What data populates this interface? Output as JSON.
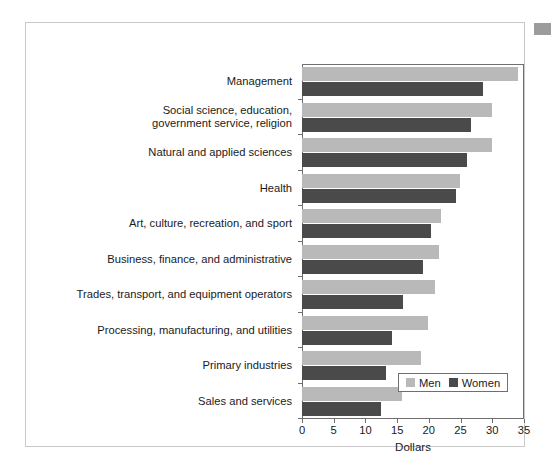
{
  "figure": {
    "axis_title": "Dollars",
    "colors": {
      "men": "#b9b9b9",
      "women": "#4a4a4a",
      "axis": "#6f6f6f",
      "frame": "#c9c9c9",
      "text": "#1a1a1a",
      "corner_swatch": "#9c9c9c"
    }
  },
  "legend": {
    "position": "bottom-right-inside",
    "entries": [
      {
        "label": "Men",
        "swatch": "men-legend-swatch"
      },
      {
        "label": "Women",
        "swatch": "women-legend-swatch"
      }
    ]
  },
  "chart_data": {
    "type": "bar",
    "orientation": "horizontal",
    "title": "",
    "subtitle": "",
    "xlabel": "Dollars",
    "ylabel": "",
    "xlim": [
      0,
      35
    ],
    "xticks": [
      0,
      5,
      10,
      15,
      20,
      25,
      30,
      35
    ],
    "xtick_labels": [
      "0",
      "5",
      "10",
      "15",
      "20",
      "25",
      "30",
      "35"
    ],
    "grid": false,
    "categories": [
      "Management",
      "Social science, education,\ngovernment service, religion",
      "Natural and applied sciences",
      "Health",
      "Art, culture, recreation, and sport",
      "Business, finance, and administrative",
      "Trades, transport, and equipment operators",
      "Processing, manufacturing, and utilities",
      "Primary industries",
      "Sales and services"
    ],
    "series": [
      {
        "name": "Men",
        "color": "#b9b9b9",
        "values": [
          34.1,
          29.9,
          29.9,
          24.9,
          21.9,
          21.6,
          20.9,
          19.8,
          18.8,
          15.8
        ]
      },
      {
        "name": "Women",
        "color": "#4a4a4a",
        "values": [
          28.6,
          26.7,
          26.0,
          24.3,
          20.4,
          19.1,
          15.9,
          14.2,
          13.2,
          12.4
        ]
      }
    ]
  }
}
